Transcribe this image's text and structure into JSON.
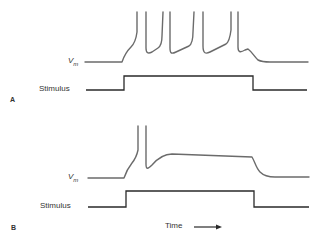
{
  "panels": [
    {
      "id": "A",
      "label": "A",
      "trace_label_main": "V",
      "trace_label_sub": "m",
      "stimulus_label": "Stimulus",
      "description": "Repetitive action potential firing (4 spikes) during sustained stimulus"
    },
    {
      "id": "B",
      "label": "B",
      "trace_label_main": "V",
      "trace_label_sub": "m",
      "stimulus_label": "Stimulus",
      "description": "Single action potential followed by sustained depolarized plateau during stimulus"
    }
  ],
  "axis": {
    "time_label": "Time"
  },
  "colors": {
    "vm_trace": "#6b6b6b",
    "stimulus_trace": "#2a2a2a",
    "text": "#333333"
  }
}
